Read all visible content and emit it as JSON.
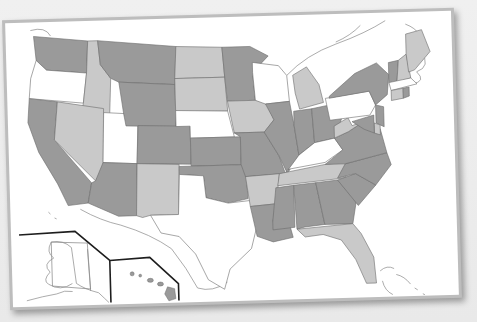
{
  "map": {
    "title": "",
    "type": "choropleth",
    "colors": {
      "dark": "#9a9a9a",
      "medium": "#c9c9c9",
      "light": "#ffffff",
      "border": "#6e6e6e",
      "inset_border": "#1e1e1e",
      "frame": "#bdbdbd",
      "background": "#ededed"
    },
    "legend": [],
    "states": [
      {
        "id": "WA",
        "shade": "dark"
      },
      {
        "id": "OR",
        "shade": "light"
      },
      {
        "id": "CA",
        "shade": "dark"
      },
      {
        "id": "ID",
        "shade": "medium"
      },
      {
        "id": "NV",
        "shade": "medium"
      },
      {
        "id": "UT",
        "shade": "light"
      },
      {
        "id": "AZ",
        "shade": "dark"
      },
      {
        "id": "MT",
        "shade": "dark"
      },
      {
        "id": "WY",
        "shade": "dark"
      },
      {
        "id": "CO",
        "shade": "dark"
      },
      {
        "id": "NM",
        "shade": "medium"
      },
      {
        "id": "ND",
        "shade": "medium"
      },
      {
        "id": "SD",
        "shade": "medium"
      },
      {
        "id": "NE",
        "shade": "light"
      },
      {
        "id": "KS",
        "shade": "dark"
      },
      {
        "id": "OK",
        "shade": "dark"
      },
      {
        "id": "TX",
        "shade": "light"
      },
      {
        "id": "MN",
        "shade": "dark"
      },
      {
        "id": "IA",
        "shade": "medium"
      },
      {
        "id": "MO",
        "shade": "dark"
      },
      {
        "id": "AR",
        "shade": "medium"
      },
      {
        "id": "LA",
        "shade": "dark"
      },
      {
        "id": "WI",
        "shade": "light"
      },
      {
        "id": "IL",
        "shade": "dark"
      },
      {
        "id": "MI",
        "shade": "medium"
      },
      {
        "id": "IN",
        "shade": "dark"
      },
      {
        "id": "OH",
        "shade": "dark"
      },
      {
        "id": "KY",
        "shade": "light"
      },
      {
        "id": "TN",
        "shade": "medium"
      },
      {
        "id": "MS",
        "shade": "dark"
      },
      {
        "id": "AL",
        "shade": "dark"
      },
      {
        "id": "GA",
        "shade": "dark"
      },
      {
        "id": "FL",
        "shade": "medium"
      },
      {
        "id": "SC",
        "shade": "dark"
      },
      {
        "id": "NC",
        "shade": "dark"
      },
      {
        "id": "VA",
        "shade": "dark"
      },
      {
        "id": "WV",
        "shade": "medium"
      },
      {
        "id": "PA",
        "shade": "light"
      },
      {
        "id": "NY",
        "shade": "dark"
      },
      {
        "id": "VT",
        "shade": "dark"
      },
      {
        "id": "NH",
        "shade": "medium"
      },
      {
        "id": "ME",
        "shade": "medium"
      },
      {
        "id": "MA",
        "shade": "light"
      },
      {
        "id": "CT",
        "shade": "medium"
      },
      {
        "id": "RI",
        "shade": "dark"
      },
      {
        "id": "NJ",
        "shade": "dark"
      },
      {
        "id": "DE",
        "shade": "medium"
      },
      {
        "id": "MD",
        "shade": "dark"
      },
      {
        "id": "AK",
        "shade": "light"
      },
      {
        "id": "HI",
        "shade": "dark"
      }
    ],
    "insets": [
      "Alaska",
      "Hawaii"
    ]
  }
}
